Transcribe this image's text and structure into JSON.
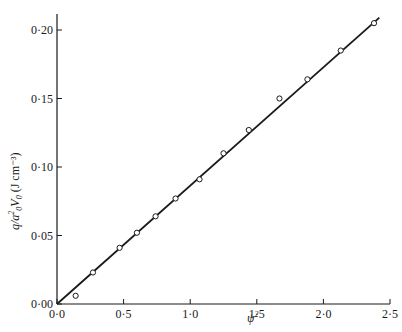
{
  "chart_data": {
    "type": "scatter",
    "title": "",
    "xlabel": "ψ²",
    "ylabel": "q/a²₀V₀  (J cm⁻³)",
    "ylabel_parts": {
      "main": "q/a",
      "sup": "2",
      "sub0": "0",
      "v": "V",
      "sub1": "0",
      "units": "(J cm⁻³)"
    },
    "xlim": [
      0,
      2.5
    ],
    "ylim": [
      0,
      0.22
    ],
    "x_ticks": [
      0.0,
      0.5,
      1.0,
      1.5,
      2.0,
      2.5
    ],
    "x_tick_labels": [
      "0·0",
      "0·5",
      "1·0",
      "1·5",
      "2·0",
      "2·5"
    ],
    "y_ticks": [
      0.0,
      0.05,
      0.1,
      0.15,
      0.2
    ],
    "y_tick_labels": [
      "0·00",
      "0·05",
      "0·10",
      "0·15",
      "0·20"
    ],
    "grid": false,
    "legend": null,
    "series": [
      {
        "name": "measured",
        "marker": "open-circle",
        "x": [
          0.14,
          0.27,
          0.47,
          0.6,
          0.74,
          0.89,
          1.07,
          1.25,
          1.44,
          1.67,
          1.88,
          2.13,
          2.38
        ],
        "y": [
          0.006,
          0.023,
          0.041,
          0.052,
          0.064,
          0.077,
          0.091,
          0.11,
          0.127,
          0.15,
          0.164,
          0.185,
          0.205
        ]
      },
      {
        "name": "fit",
        "type": "line",
        "x": [
          0.0,
          2.42
        ],
        "y": [
          0.0,
          0.209
        ]
      }
    ]
  }
}
